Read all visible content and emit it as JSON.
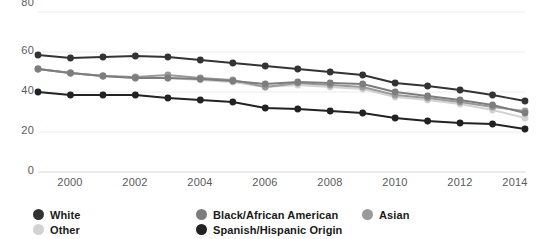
{
  "chart_data": {
    "type": "line",
    "title": "",
    "subtitle": "",
    "xlabel": "",
    "ylabel": "",
    "x": [
      1999,
      2000,
      2001,
      2002,
      2003,
      2004,
      2005,
      2006,
      2007,
      2008,
      2009,
      2010,
      2011,
      2012,
      2013,
      2014
    ],
    "xlim": [
      1999,
      2014
    ],
    "ylim": [
      0,
      80
    ],
    "yticks": [
      0,
      20,
      40,
      60,
      80
    ],
    "ytick_labels": [
      "0",
      "20",
      "40",
      "60",
      "80"
    ],
    "xticks": [
      2000,
      2002,
      2004,
      2006,
      2008,
      2010,
      2012,
      2014
    ],
    "xtick_labels": [
      "2000",
      "2002",
      "2004",
      "2006",
      "2008",
      "2010",
      "2012",
      "2014"
    ],
    "grid": true,
    "grid_axis": "y",
    "legend_position": "bottom",
    "series": [
      {
        "name": "White",
        "color": "#333333",
        "marker": "circle",
        "values": [
          58.5,
          57.0,
          57.5,
          58.0,
          57.5,
          56.0,
          54.5,
          53.0,
          51.5,
          50.0,
          48.5,
          44.5,
          43.0,
          41.0,
          38.5,
          35.5
        ]
      },
      {
        "name": "Black/African American",
        "color": "#7d7d7d",
        "marker": "circle",
        "values": [
          51.5,
          49.5,
          48.0,
          47.0,
          47.0,
          46.5,
          45.5,
          44.0,
          45.0,
          44.5,
          44.0,
          40.0,
          38.0,
          36.0,
          33.5,
          29.5
        ]
      },
      {
        "name": "Asian",
        "color": "#9a9a9a",
        "marker": "circle",
        "values": [
          51.5,
          49.5,
          48.0,
          47.5,
          48.5,
          47.0,
          46.0,
          42.5,
          44.5,
          43.5,
          42.5,
          38.5,
          37.0,
          35.0,
          32.5,
          30.5
        ]
      },
      {
        "name": "Other",
        "color": "#d2d2d2",
        "marker": "circle",
        "values": [
          51.5,
          49.5,
          48.0,
          47.0,
          47.0,
          46.0,
          45.0,
          42.5,
          43.5,
          42.5,
          41.5,
          37.5,
          36.0,
          34.0,
          31.0,
          27.0
        ]
      },
      {
        "name": "Spanish/Hispanic Origin",
        "color": "#222222",
        "marker": "circle",
        "values": [
          40.0,
          38.5,
          38.5,
          38.5,
          37.0,
          36.0,
          35.0,
          32.0,
          31.5,
          30.5,
          29.5,
          27.0,
          25.5,
          24.5,
          24.0,
          21.5
        ]
      }
    ]
  },
  "axis": {
    "y_labels": [
      "80",
      "60",
      "40",
      "20",
      "0"
    ],
    "x_labels": [
      "2000",
      "2002",
      "2004",
      "2006",
      "2008",
      "2010",
      "2012",
      "2014"
    ]
  },
  "legend": {
    "items": [
      {
        "label": "White",
        "color": "#333333"
      },
      {
        "label": "Black/African American",
        "color": "#7d7d7d"
      },
      {
        "label": "Asian",
        "color": "#9a9a9a"
      },
      {
        "label": "Other",
        "color": "#d2d2d2"
      },
      {
        "label": "Spanish/Hispanic Origin",
        "color": "#222222"
      }
    ]
  },
  "colors": {
    "axis_text": "#5a5a5a",
    "grid": "#ececec",
    "axis_line": "#d8d8d8",
    "background": "#ffffff"
  }
}
